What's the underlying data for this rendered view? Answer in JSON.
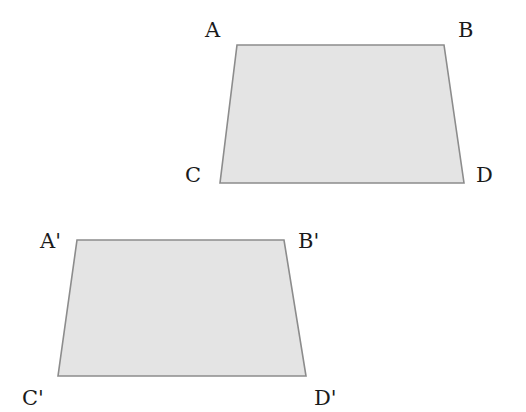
{
  "diagram": {
    "type": "geometry-translation",
    "colors": {
      "fill": "#e4e4e4",
      "stroke": "#8c8c8c",
      "text": "#1a1a1a"
    },
    "shapes": [
      {
        "name": "trapezoid-ABDC",
        "vertices": {
          "A": [
            237,
            45
          ],
          "B": [
            444,
            45
          ],
          "D": [
            464,
            183
          ],
          "C": [
            220,
            183
          ]
        },
        "labels": [
          {
            "text": "A",
            "x": 205,
            "y": 37
          },
          {
            "text": "B",
            "x": 458,
            "y": 37
          },
          {
            "text": "C",
            "x": 185,
            "y": 182
          },
          {
            "text": "D",
            "x": 476,
            "y": 182
          }
        ]
      },
      {
        "name": "trapezoid-A'B'D'C'",
        "vertices": {
          "A'": [
            77,
            240
          ],
          "B'": [
            284,
            240
          ],
          "D'": [
            306,
            376
          ],
          "C'": [
            58,
            376
          ]
        },
        "labels": [
          {
            "text": "A'",
            "x": 40,
            "y": 237
          },
          {
            "text": "B'",
            "x": 298,
            "y": 237
          },
          {
            "text": "C'",
            "x": 22,
            "y": 407
          },
          {
            "text": "D'",
            "x": 314,
            "y": 407
          }
        ]
      }
    ]
  }
}
